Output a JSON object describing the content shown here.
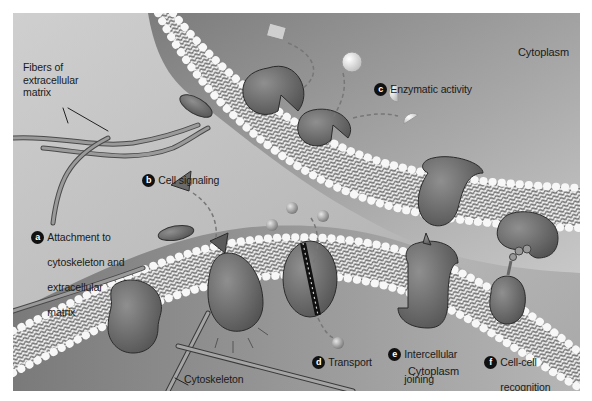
{
  "figure": {
    "regions": {
      "cytoplasm_top": "Cytoplasm",
      "cytoplasm_bottom": "Cytoplasm"
    },
    "labels": {
      "fibers": [
        "Fibers of",
        "extracellular",
        "matrix"
      ],
      "cytoskeleton": "Cytoskeleton"
    },
    "functions": [
      {
        "letter": "a",
        "lines": [
          "Attachment to",
          "cytoskeleton and",
          "extracellular",
          "matrix"
        ]
      },
      {
        "letter": "b",
        "lines": [
          "Cell signaling"
        ]
      },
      {
        "letter": "c",
        "lines": [
          "Enzymatic activity"
        ]
      },
      {
        "letter": "d",
        "lines": [
          "Transport"
        ]
      },
      {
        "letter": "e",
        "lines": [
          "Intercellular",
          "joining"
        ]
      },
      {
        "letter": "f",
        "lines": [
          "Cell-cell",
          "recognition"
        ]
      }
    ],
    "colors": {
      "background": "#b9b9b9",
      "protein": "#6f6f6f",
      "protein_outline": "#2b2b2b",
      "lipid_head": "#f2f2f2",
      "badge": "#111111",
      "text": "#1a1a1a"
    }
  }
}
